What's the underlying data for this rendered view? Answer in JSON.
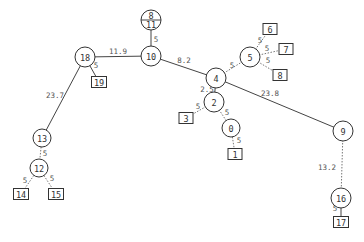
{
  "diagram": {
    "type": "tree",
    "nodes": [
      {
        "id": "8_11",
        "label_top": "8",
        "label_bottom": "11",
        "shape": "split-circle",
        "x": 151,
        "y": 20,
        "r": 10
      },
      {
        "id": "10",
        "label": "10",
        "shape": "circle",
        "x": 151,
        "y": 56,
        "r": 10
      },
      {
        "id": "18",
        "label": "18",
        "shape": "circle",
        "x": 85,
        "y": 57,
        "r": 10
      },
      {
        "id": "19",
        "label": "19",
        "shape": "box",
        "x": 99,
        "y": 82,
        "w": 15,
        "h": 11
      },
      {
        "id": "13",
        "label": "13",
        "shape": "circle",
        "x": 42,
        "y": 138,
        "r": 9
      },
      {
        "id": "12",
        "label": "12",
        "shape": "circle",
        "x": 39,
        "y": 168,
        "r": 9
      },
      {
        "id": "14",
        "label": "14",
        "shape": "box",
        "x": 21,
        "y": 194,
        "w": 15,
        "h": 11
      },
      {
        "id": "15",
        "label": "15",
        "shape": "box",
        "x": 56,
        "y": 194,
        "w": 15,
        "h": 11
      },
      {
        "id": "4",
        "label": "4",
        "shape": "circle",
        "x": 216,
        "y": 78,
        "r": 10
      },
      {
        "id": "5",
        "label": "5",
        "shape": "circle",
        "x": 250,
        "y": 57,
        "r": 10
      },
      {
        "id": "6",
        "label": "6",
        "shape": "box",
        "x": 270,
        "y": 29,
        "w": 14,
        "h": 11
      },
      {
        "id": "7",
        "label": "7",
        "shape": "box",
        "x": 286,
        "y": 49,
        "w": 14,
        "h": 11
      },
      {
        "id": "8",
        "label": "8",
        "shape": "box",
        "x": 280,
        "y": 75,
        "w": 14,
        "h": 11
      },
      {
        "id": "2",
        "label": "2",
        "shape": "circle",
        "x": 214,
        "y": 102,
        "r": 10
      },
      {
        "id": "3",
        "label": "3",
        "shape": "box",
        "x": 186,
        "y": 118,
        "w": 14,
        "h": 11
      },
      {
        "id": "0",
        "label": "0",
        "shape": "circle",
        "x": 231,
        "y": 128,
        "r": 9
      },
      {
        "id": "1",
        "label": "1",
        "shape": "box",
        "x": 235,
        "y": 154,
        "w": 14,
        "h": 11
      },
      {
        "id": "9",
        "label": "9",
        "shape": "circle",
        "x": 343,
        "y": 131,
        "r": 10
      },
      {
        "id": "16",
        "label": "16",
        "shape": "circle",
        "x": 341,
        "y": 198,
        "r": 10
      },
      {
        "id": "17",
        "label": "17",
        "shape": "box",
        "x": 341,
        "y": 222,
        "w": 15,
        "h": 11
      }
    ],
    "edges": [
      {
        "from": "10",
        "to": "8_11",
        "label": "5",
        "style": "solid",
        "lx": 156,
        "ly": 39
      },
      {
        "from": "18",
        "to": "10",
        "label": "11.9",
        "style": "solid",
        "lx": 118,
        "ly": 51
      },
      {
        "from": "18",
        "to": "19",
        "label": "5",
        "style": "solid",
        "lx": 96,
        "ly": 65
      },
      {
        "from": "18",
        "to": "13",
        "label": "23.7",
        "style": "solid",
        "lx": 55,
        "ly": 95
      },
      {
        "from": "13",
        "to": "12",
        "label": "5",
        "style": "dotted",
        "lx": 45,
        "ly": 153
      },
      {
        "from": "12",
        "to": "14",
        "label": "5",
        "style": "dotted",
        "lx": 25,
        "ly": 180
      },
      {
        "from": "12",
        "to": "15",
        "label": "5",
        "style": "dotted",
        "lx": 52,
        "ly": 178
      },
      {
        "from": "10",
        "to": "4",
        "label": "8.2",
        "style": "solid",
        "lx": 184,
        "ly": 60
      },
      {
        "from": "4",
        "to": "5",
        "label": "5",
        "style": "dotted",
        "lx": 232,
        "ly": 65
      },
      {
        "from": "5",
        "to": "6",
        "label": "5",
        "style": "dotted",
        "lx": 260,
        "ly": 40
      },
      {
        "from": "5",
        "to": "7",
        "label": "5",
        "style": "dotted",
        "lx": 267,
        "ly": 48
      },
      {
        "from": "5",
        "to": "8",
        "label": "5",
        "style": "dotted",
        "lx": 268,
        "ly": 60
      },
      {
        "from": "4",
        "to": "2",
        "label": "2.5",
        "style": "solid",
        "lx": 207,
        "ly": 89
      },
      {
        "from": "2",
        "to": "3",
        "label": "5",
        "style": "dotted",
        "lx": 198,
        "ly": 106
      },
      {
        "from": "2",
        "to": "0",
        "label": "5",
        "style": "dotted",
        "lx": 227,
        "ly": 112
      },
      {
        "from": "0",
        "to": "1",
        "label": "5",
        "style": "dotted",
        "lx": 239,
        "ly": 140
      },
      {
        "from": "4",
        "to": "9",
        "label": "23.8",
        "style": "solid",
        "lx": 270,
        "ly": 93
      },
      {
        "from": "9",
        "to": "16",
        "label": "13.2",
        "style": "dotted",
        "lx": 327,
        "ly": 167
      },
      {
        "from": "16",
        "to": "17",
        "label": "5",
        "style": "solid",
        "lx": 335,
        "ly": 208
      }
    ],
    "colors": {
      "stroke": "#333333",
      "dotted_edge": "#777777",
      "text": "#333333",
      "edge_text": "#555555",
      "background": "#ffffff"
    }
  }
}
